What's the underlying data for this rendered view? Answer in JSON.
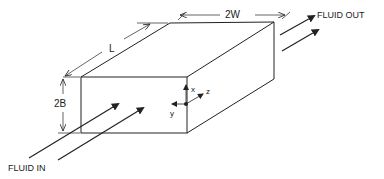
{
  "diagram": {
    "labels": {
      "length": "L",
      "width": "2W",
      "height": "2B",
      "fluid_in": "FLUID IN",
      "fluid_out": "FLUID OUT",
      "axis_x": "x",
      "axis_y": "y",
      "axis_z": "z"
    },
    "colors": {
      "stroke": "#222222",
      "background": "#ffffff"
    }
  }
}
